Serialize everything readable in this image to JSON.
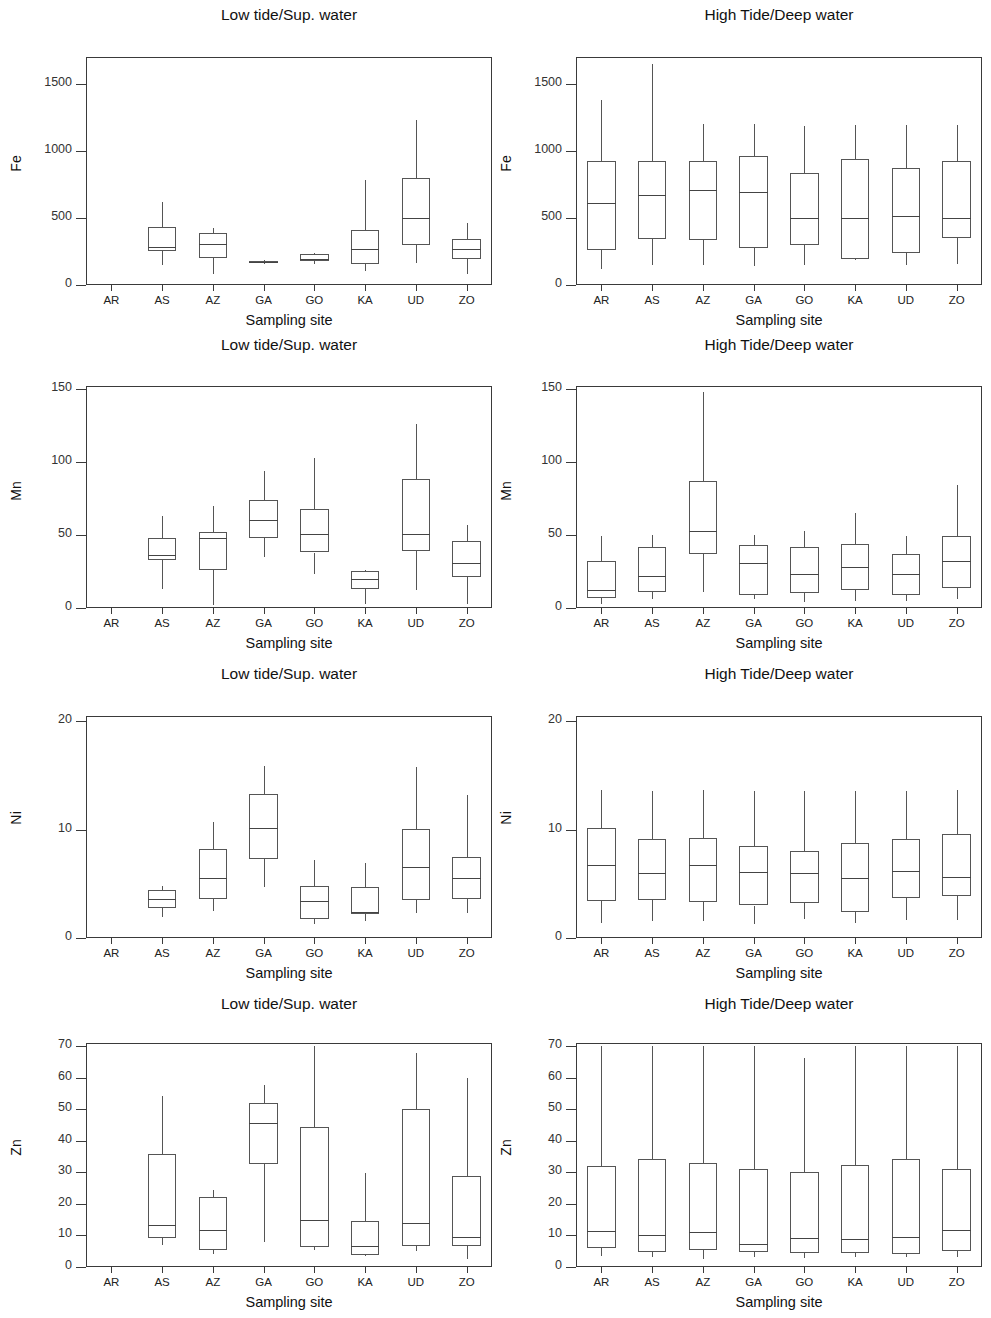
{
  "figure": {
    "sites": [
      "AR",
      "AS",
      "AZ",
      "GA",
      "GO",
      "KA",
      "UD",
      "ZO"
    ],
    "xlabel": "Sampling site",
    "panel_titles": {
      "left": "Low tide/Sup. water",
      "right": "High Tide/Deep water"
    }
  },
  "chart_data": [
    {
      "type": "box",
      "id": "fe-low",
      "title": "Low tide/Sup. water",
      "ylabel": "Fe",
      "xlabel": "Sampling site",
      "categories": [
        "AR",
        "AS",
        "AZ",
        "GA",
        "GO",
        "KA",
        "UD",
        "ZO"
      ],
      "ylim": [
        0,
        1700
      ],
      "yticks": [
        0,
        500,
        1000,
        1500
      ],
      "grid": false,
      "boxes": [
        {
          "site": "AR",
          "min": null,
          "q1": null,
          "median": null,
          "q3": null,
          "max": null
        },
        {
          "site": "AS",
          "min": 148,
          "q1": 250,
          "median": 285,
          "q3": 434,
          "max": 616
        },
        {
          "site": "AZ",
          "min": 85,
          "q1": 198,
          "median": 307,
          "q3": 386,
          "max": 428
        },
        {
          "site": "GA",
          "min": 153,
          "q1": 162,
          "median": 170,
          "q3": 178,
          "max": 190
        },
        {
          "site": "GO",
          "min": 158,
          "q1": 180,
          "median": 192,
          "q3": 228,
          "max": 238
        },
        {
          "site": "KA",
          "min": 106,
          "q1": 160,
          "median": 268,
          "q3": 413,
          "max": 784
        },
        {
          "site": "UD",
          "min": 163,
          "q1": 300,
          "median": 503,
          "q3": 800,
          "max": 1232
        },
        {
          "site": "ZO",
          "min": 81,
          "q1": 192,
          "median": 272,
          "q3": 344,
          "max": 462
        }
      ]
    },
    {
      "type": "box",
      "id": "fe-high",
      "title": "High Tide/Deep water",
      "ylabel": "Fe",
      "xlabel": "Sampling site",
      "categories": [
        "AR",
        "AS",
        "AZ",
        "GA",
        "GO",
        "KA",
        "UD",
        "ZO"
      ],
      "ylim": [
        0,
        1700
      ],
      "yticks": [
        0,
        500,
        1000,
        1500
      ],
      "grid": false,
      "boxes": [
        {
          "site": "AR",
          "min": 120,
          "q1": 263,
          "median": 608,
          "q3": 925,
          "max": 1379
        },
        {
          "site": "AS",
          "min": 148,
          "q1": 340,
          "median": 672,
          "q3": 923,
          "max": 1647
        },
        {
          "site": "AZ",
          "min": 150,
          "q1": 339,
          "median": 710,
          "q3": 925,
          "max": 1204
        },
        {
          "site": "GA",
          "min": 143,
          "q1": 277,
          "median": 693,
          "q3": 960,
          "max": 1200
        },
        {
          "site": "GO",
          "min": 150,
          "q1": 299,
          "median": 496,
          "q3": 835,
          "max": 1182
        },
        {
          "site": "KA",
          "min": 190,
          "q1": 197,
          "median": 497,
          "q3": 940,
          "max": 1195
        },
        {
          "site": "UD",
          "min": 148,
          "q1": 242,
          "median": 511,
          "q3": 873,
          "max": 1190
        },
        {
          "site": "ZO",
          "min": 154,
          "q1": 347,
          "median": 498,
          "q3": 925,
          "max": 1190
        }
      ]
    },
    {
      "type": "box",
      "id": "mn-low",
      "title": "Low tide/Sup. water",
      "ylabel": "Mn",
      "xlabel": "Sampling site",
      "categories": [
        "AR",
        "AS",
        "AZ",
        "GA",
        "GO",
        "KA",
        "UD",
        "ZO"
      ],
      "ylim": [
        0,
        152
      ],
      "yticks": [
        0,
        50,
        100,
        150
      ],
      "grid": false,
      "boxes": [
        {
          "site": "AR",
          "min": null,
          "q1": null,
          "median": null,
          "q3": null,
          "max": null
        },
        {
          "site": "AS",
          "min": 13,
          "q1": 33,
          "median": 36,
          "q3": 48,
          "max": 63
        },
        {
          "site": "AZ",
          "min": 2,
          "q1": 26,
          "median": 48,
          "q3": 52,
          "max": 70
        },
        {
          "site": "GA",
          "min": 35,
          "q1": 48,
          "median": 60,
          "q3": 74,
          "max": 94
        },
        {
          "site": "GO",
          "min": 23,
          "q1": 38,
          "median": 51,
          "q3": 68,
          "max": 103
        },
        {
          "site": "KA",
          "min": 3,
          "q1": 13,
          "median": 20,
          "q3": 25,
          "max": 26
        },
        {
          "site": "UD",
          "min": 12,
          "q1": 39,
          "median": 51,
          "q3": 88,
          "max": 126
        },
        {
          "site": "ZO",
          "min": 3,
          "q1": 21,
          "median": 31,
          "q3": 46,
          "max": 57
        }
      ]
    },
    {
      "type": "box",
      "id": "mn-high",
      "title": "High Tide/Deep water",
      "ylabel": "Mn",
      "xlabel": "Sampling site",
      "categories": [
        "AR",
        "AS",
        "AZ",
        "GA",
        "GO",
        "KA",
        "UD",
        "ZO"
      ],
      "ylim": [
        0,
        152
      ],
      "yticks": [
        0,
        50,
        100,
        150
      ],
      "grid": false,
      "boxes": [
        {
          "site": "AR",
          "min": 3,
          "q1": 7,
          "median": 12,
          "q3": 32,
          "max": 49
        },
        {
          "site": "AS",
          "min": 6,
          "q1": 11,
          "median": 22,
          "q3": 42,
          "max": 50
        },
        {
          "site": "AZ",
          "min": 11,
          "q1": 37,
          "median": 53,
          "q3": 87,
          "max": 148
        },
        {
          "site": "GA",
          "min": 6,
          "q1": 9,
          "median": 31,
          "q3": 43,
          "max": 50
        },
        {
          "site": "GO",
          "min": 4,
          "q1": 10,
          "median": 23,
          "q3": 42,
          "max": 53
        },
        {
          "site": "KA",
          "min": 5,
          "q1": 12,
          "median": 28,
          "q3": 44,
          "max": 65
        },
        {
          "site": "UD",
          "min": 5,
          "q1": 9,
          "median": 23,
          "q3": 37,
          "max": 49
        },
        {
          "site": "ZO",
          "min": 6,
          "q1": 14,
          "median": 32,
          "q3": 49,
          "max": 84
        }
      ]
    },
    {
      "type": "box",
      "id": "ni-low",
      "title": "Low tide/Sup. water",
      "ylabel": "Ni",
      "xlabel": "Sampling site",
      "categories": [
        "AR",
        "AS",
        "AZ",
        "GA",
        "GO",
        "KA",
        "UD",
        "ZO"
      ],
      "ylim": [
        0,
        20.5
      ],
      "yticks": [
        0,
        10,
        20
      ],
      "grid": false,
      "boxes": [
        {
          "site": "AR",
          "min": null,
          "q1": null,
          "median": null,
          "q3": null,
          "max": null
        },
        {
          "site": "AS",
          "min": 1.9,
          "q1": 2.8,
          "median": 3.6,
          "q3": 4.4,
          "max": 4.8
        },
        {
          "site": "AZ",
          "min": 2.5,
          "q1": 3.6,
          "median": 5.5,
          "q3": 8.2,
          "max": 10.7
        },
        {
          "site": "GA",
          "min": 4.7,
          "q1": 7.3,
          "median": 10.2,
          "q3": 13.3,
          "max": 15.9
        },
        {
          "site": "GO",
          "min": 1.3,
          "q1": 1.8,
          "median": 3.4,
          "q3": 4.8,
          "max": 7.2
        },
        {
          "site": "KA",
          "min": 1.6,
          "q1": 2.2,
          "median": 2.4,
          "q3": 4.7,
          "max": 6.9
        },
        {
          "site": "UD",
          "min": 2.3,
          "q1": 3.5,
          "median": 6.6,
          "q3": 10.1,
          "max": 15.8
        },
        {
          "site": "ZO",
          "min": 2.3,
          "q1": 3.6,
          "median": 5.5,
          "q3": 7.5,
          "max": 13.2
        }
      ]
    },
    {
      "type": "box",
      "id": "ni-high",
      "title": "High Tide/Deep water",
      "ylabel": "Ni",
      "xlabel": "Sampling site",
      "categories": [
        "AR",
        "AS",
        "AZ",
        "GA",
        "GO",
        "KA",
        "UD",
        "ZO"
      ],
      "ylim": [
        0,
        20.5
      ],
      "yticks": [
        0,
        10,
        20
      ],
      "grid": false,
      "boxes": [
        {
          "site": "AR",
          "min": 1.4,
          "q1": 3.4,
          "median": 6.7,
          "q3": 10.2,
          "max": 13.7
        },
        {
          "site": "AS",
          "min": 1.6,
          "q1": 3.5,
          "median": 6.0,
          "q3": 9.1,
          "max": 13.6
        },
        {
          "site": "AZ",
          "min": 1.6,
          "q1": 3.3,
          "median": 6.7,
          "q3": 9.2,
          "max": 13.7
        },
        {
          "site": "GA",
          "min": 1.3,
          "q1": 3.0,
          "median": 6.1,
          "q3": 8.5,
          "max": 13.6
        },
        {
          "site": "GO",
          "min": 1.8,
          "q1": 3.2,
          "median": 6.0,
          "q3": 8.0,
          "max": 13.6
        },
        {
          "site": "KA",
          "min": 1.4,
          "q1": 2.4,
          "median": 5.5,
          "q3": 8.8,
          "max": 13.6
        },
        {
          "site": "UD",
          "min": 1.7,
          "q1": 3.7,
          "median": 6.2,
          "q3": 9.1,
          "max": 13.6
        },
        {
          "site": "ZO",
          "min": 1.7,
          "q1": 3.9,
          "median": 5.6,
          "q3": 9.6,
          "max": 13.7
        }
      ]
    },
    {
      "type": "box",
      "id": "zn-low",
      "title": "Low tide/Sup. water",
      "ylabel": "Zn",
      "xlabel": "Sampling site",
      "categories": [
        "AR",
        "AS",
        "AZ",
        "GA",
        "GO",
        "KA",
        "UD",
        "ZO"
      ],
      "ylim": [
        0,
        71
      ],
      "yticks": [
        0,
        10,
        20,
        30,
        40,
        50,
        60,
        70
      ],
      "grid": false,
      "boxes": [
        {
          "site": "AR",
          "min": null,
          "q1": null,
          "median": null,
          "q3": null,
          "max": null
        },
        {
          "site": "AS",
          "min": 7.0,
          "q1": 9.3,
          "median": 13.2,
          "q3": 35.8,
          "max": 54.3
        },
        {
          "site": "AZ",
          "min": 4.2,
          "q1": 5.3,
          "median": 11.6,
          "q3": 22.1,
          "max": 24.5
        },
        {
          "site": "GA",
          "min": 8.0,
          "q1": 32.6,
          "median": 45.6,
          "q3": 52.1,
          "max": 57.6
        },
        {
          "site": "GO",
          "min": 5.5,
          "q1": 6.4,
          "median": 14.9,
          "q3": 44.3,
          "max": 70.0
        },
        {
          "site": "KA",
          "min": 3.7,
          "q1": 3.8,
          "median": 6.7,
          "q3": 14.6,
          "max": 29.8
        },
        {
          "site": "UD",
          "min": 5.0,
          "q1": 6.7,
          "median": 14.1,
          "q3": 50.2,
          "max": 67.8
        },
        {
          "site": "ZO",
          "min": 2.6,
          "q1": 6.8,
          "median": 9.4,
          "q3": 28.9,
          "max": 60.0
        }
      ]
    },
    {
      "type": "box",
      "id": "zn-high",
      "title": "High Tide/Deep water",
      "ylabel": "Zn",
      "xlabel": "Sampling site",
      "categories": [
        "AR",
        "AS",
        "AZ",
        "GA",
        "GO",
        "KA",
        "UD",
        "ZO"
      ],
      "ylim": [
        0,
        71
      ],
      "yticks": [
        0,
        10,
        20,
        30,
        40,
        50,
        60,
        70
      ],
      "grid": false,
      "boxes": [
        {
          "site": "AR",
          "min": 3.4,
          "q1": 5.9,
          "median": 11.3,
          "q3": 32.0,
          "max": 70.0
        },
        {
          "site": "AS",
          "min": 3.2,
          "q1": 4.8,
          "median": 10.2,
          "q3": 34.1,
          "max": 70.0
        },
        {
          "site": "AZ",
          "min": 2.6,
          "q1": 5.3,
          "median": 11.1,
          "q3": 33.1,
          "max": 70.0
        },
        {
          "site": "GA",
          "min": 3.1,
          "q1": 4.7,
          "median": 7.4,
          "q3": 31.0,
          "max": 70.0
        },
        {
          "site": "GO",
          "min": 2.8,
          "q1": 4.5,
          "median": 9.1,
          "q3": 30.2,
          "max": 66.4
        },
        {
          "site": "KA",
          "min": 3.1,
          "q1": 4.5,
          "median": 8.8,
          "q3": 32.2,
          "max": 70.0
        },
        {
          "site": "UD",
          "min": 3.2,
          "q1": 4.2,
          "median": 9.6,
          "q3": 34.1,
          "max": 70.0
        },
        {
          "site": "ZO",
          "min": 3.3,
          "q1": 5.1,
          "median": 11.7,
          "q3": 31.2,
          "max": 70.0
        }
      ]
    }
  ]
}
